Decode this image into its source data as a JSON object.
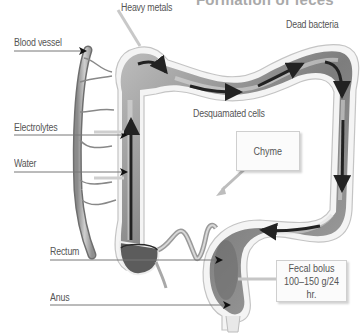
{
  "title": "Formation of feces",
  "labels": {
    "heavy_metals": "Heavy metals",
    "dead_bacteria": "Dead bacteria",
    "blood_vessel": "Blood vessel",
    "electrolytes": "Electrolytes",
    "water": "Water",
    "desquamated_cells": "Desquamated cells",
    "chyme": "Chyme",
    "rectum": "Rectum",
    "anus": "Anus",
    "fecal_bolus_line1": "Fecal bolus",
    "fecal_bolus_line2": "100–150 g/24 hr."
  },
  "colors": {
    "text": "#555555",
    "title": "#a9a9a9",
    "colon_dark": "#5a5a5a",
    "colon_light": "#cfcfcf",
    "outline": "#f2f2f2",
    "arrow": "#1a1a1a"
  }
}
